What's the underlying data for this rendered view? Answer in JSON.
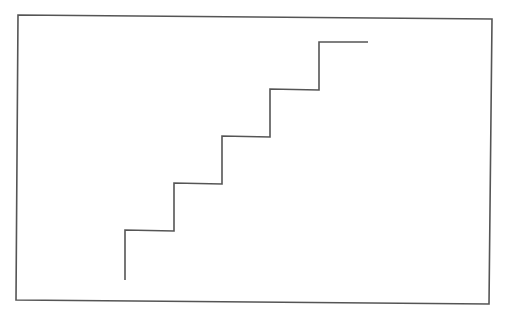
{
  "diagram": {
    "frame": {
      "points": [
        [
          18,
          15
        ],
        [
          492,
          19
        ],
        [
          489,
          304
        ],
        [
          16,
          300
        ]
      ],
      "stroke": "#555555",
      "stroke_width": 1.6
    },
    "staircase": {
      "steps": 5,
      "points": [
        [
          125,
          280
        ],
        [
          125,
          230
        ],
        [
          174,
          231
        ],
        [
          174,
          183
        ],
        [
          222,
          184
        ],
        [
          222,
          136
        ],
        [
          270,
          137
        ],
        [
          270,
          89
        ],
        [
          319,
          90
        ],
        [
          319,
          42
        ],
        [
          368,
          42
        ]
      ],
      "stroke": "#555555",
      "stroke_width": 1.6
    },
    "background": "#ffffff"
  }
}
